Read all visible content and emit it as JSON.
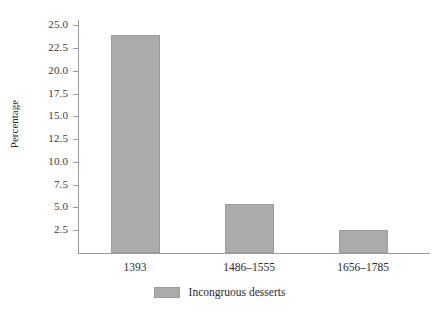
{
  "chart_data": {
    "type": "bar",
    "title": "",
    "subtitle": "",
    "xlabel": "",
    "ylabel": "Percentage",
    "categories": [
      "1393",
      "1486–1555",
      "1656–1785"
    ],
    "values": [
      23.9,
      5.4,
      2.5
    ],
    "series": [
      {
        "name": "Incongruous desserts",
        "values": [
          23.9,
          5.4,
          2.5
        ],
        "color": "#ababab"
      }
    ],
    "ylim": [
      0,
      25.6
    ],
    "ytick_labels": [
      "2.5",
      "5.0",
      "7.5",
      "10.0",
      "12.5",
      "15.0",
      "17.5",
      "20.0",
      "22.5",
      "25.0"
    ],
    "ytick_values": [
      2.5,
      5.0,
      7.5,
      10.0,
      12.5,
      15.0,
      17.5,
      20.0,
      22.5,
      25.0
    ],
    "grid": false,
    "legend_position": "bottom-center",
    "legend_entries": [
      "Incongruous desserts"
    ],
    "annotations": [],
    "colors": {
      "bar_fill": "#ababab",
      "bar_edge": "#9b9b9b",
      "axis": "#9a9a9a",
      "text": "#2b2b2b",
      "background": "#ffffff"
    }
  },
  "legend": {
    "label": "Incongruous desserts"
  }
}
